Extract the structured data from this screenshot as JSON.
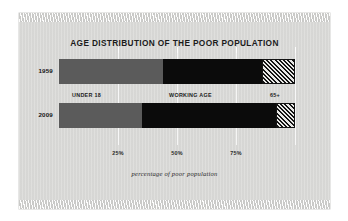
{
  "chart_data": {
    "type": "bar",
    "orientation": "horizontal-stacked",
    "title": "AGE DISTRIBUTION OF THE POOR POPULATION",
    "xlabel": "percentage of poor population",
    "ylabel": "",
    "xlim": [
      0,
      100
    ],
    "grid": true,
    "legend_position": "inline-between-bars",
    "tick_labels": [
      "25%",
      "50%",
      "75%"
    ],
    "tick_values": [
      25,
      50,
      75
    ],
    "categories": [
      "1959",
      "2009"
    ],
    "series": [
      {
        "name": "UNDER 18",
        "values": [
          44,
          35
        ],
        "color": "#5b5b5b"
      },
      {
        "name": "WORKING AGE",
        "values": [
          42,
          57
        ],
        "color": "#0b0b0b"
      },
      {
        "name": "65+",
        "values": [
          14,
          8
        ],
        "color": "#e8e8e6"
      }
    ],
    "annotations": [
      {
        "text": "UNDER 18",
        "at_percent": 14
      },
      {
        "text": "WORKING AGE",
        "at_percent": 57
      },
      {
        "text": "65+",
        "at_percent": 93
      }
    ]
  },
  "chart": {
    "title": "AGE DISTRIBUTION OF THE POOR POPULATION",
    "caption": "percentage of poor population",
    "rows": [
      {
        "year": "1959",
        "segments": [
          {
            "label": "UNDER 18",
            "percent": 44
          },
          {
            "label": "WORKING AGE",
            "percent": 42
          },
          {
            "label": "65+",
            "percent": 14
          }
        ]
      },
      {
        "year": "2009",
        "segments": [
          {
            "label": "UNDER 18",
            "percent": 35
          },
          {
            "label": "WORKING AGE",
            "percent": 57
          },
          {
            "label": "65+",
            "percent": 8
          }
        ]
      }
    ],
    "ticks": [
      {
        "label": "25%",
        "value": 25
      },
      {
        "label": "50%",
        "value": 50
      },
      {
        "label": "75%",
        "value": 75
      }
    ],
    "legend": [
      {
        "label": "UNDER 18"
      },
      {
        "label": "WORKING AGE"
      },
      {
        "label": "65+"
      }
    ],
    "colors": {
      "under18": "#5b5b5b",
      "working": "#0b0b0b",
      "senior_hatch": "#141414",
      "paper": "#d9d9d7"
    }
  }
}
